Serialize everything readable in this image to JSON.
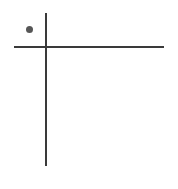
{
  "figure": {
    "width": 178,
    "height": 189,
    "background_color": "#ffffff",
    "title": "",
    "subtitle": "",
    "caption": "",
    "has_text": false,
    "has_tick_labels": false,
    "has_legend": false,
    "has_gridlines": false
  },
  "axes": {
    "line_color": "#3a3a3a",
    "line_width_px": 2,
    "origin": {
      "x_px": 46,
      "y_px": 47
    },
    "y_axis": {
      "name": "y-axis-line",
      "orientation": "vertical",
      "x_px": 46,
      "y_start_px": 13,
      "y_end_px": 166,
      "length_px": 153,
      "label": "",
      "ticks": []
    },
    "x_axis": {
      "name": "x-axis-line",
      "orientation": "horizontal",
      "y_px": 47,
      "x_start_px": 14,
      "x_end_px": 164,
      "length_px": 150,
      "label": "",
      "ticks": []
    }
  },
  "chart_data": {
    "type": "scatter",
    "title": "",
    "subtitle": "",
    "xlabel": "",
    "ylabel": "",
    "xlim": [
      -32,
      118
    ],
    "ylim": [
      -119,
      34
    ],
    "grid": false,
    "legend": null,
    "legend_position": "none",
    "xticks": [],
    "yticks": [],
    "xticklabels": [],
    "yticklabels": [],
    "annotations": [],
    "series": [
      {
        "name": "point",
        "type": "scatter",
        "color": "#565656",
        "marker": "circle",
        "marker_size_px": 7,
        "points": [
          {
            "label": "",
            "x": -16.5,
            "y": 17.5,
            "px_x": 29.5,
            "px_y": 29.5,
            "quadrant": "upper-left"
          }
        ]
      }
    ],
    "point_count": 1
  }
}
